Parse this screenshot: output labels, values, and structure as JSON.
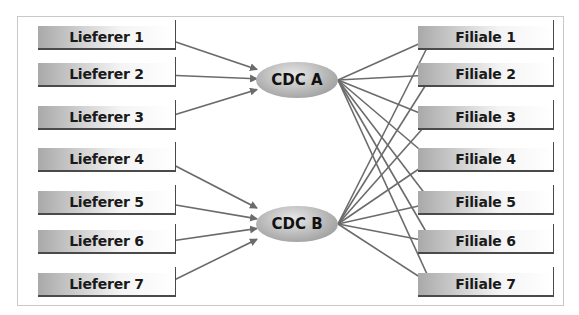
{
  "diagram": {
    "suppliers": [
      {
        "label": "Lieferer 1",
        "y": 26
      },
      {
        "label": "Lieferer 2",
        "y": 63
      },
      {
        "label": "Lieferer 3",
        "y": 106
      },
      {
        "label": "Lieferer 4",
        "y": 148
      },
      {
        "label": "Lieferer 5",
        "y": 191
      },
      {
        "label": "Lieferer 6",
        "y": 230
      },
      {
        "label": "Lieferer 7",
        "y": 273
      }
    ],
    "hubs": [
      {
        "label": "CDC A",
        "cx": 297,
        "cy": 80,
        "suppliers": [
          1,
          2,
          3
        ]
      },
      {
        "label": "CDC B",
        "cx": 297,
        "cy": 224,
        "suppliers": [
          4,
          5,
          6,
          7
        ]
      }
    ],
    "branches": [
      {
        "label": "Filiale 1",
        "y": 26
      },
      {
        "label": "Filiale 2",
        "y": 63
      },
      {
        "label": "Filiale 3",
        "y": 106
      },
      {
        "label": "Filiale 4",
        "y": 148
      },
      {
        "label": "Filiale 5",
        "y": 191
      },
      {
        "label": "Filiale 6",
        "y": 230
      },
      {
        "label": "Filiale 7",
        "y": 273
      }
    ],
    "arrow_color": "#6b6b6b",
    "hub_to_branch": "all"
  }
}
